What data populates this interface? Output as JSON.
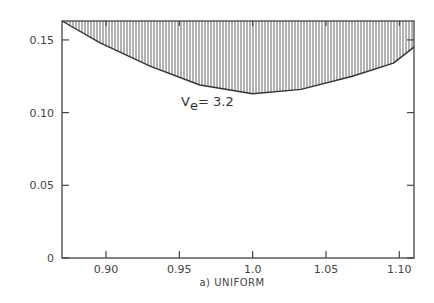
{
  "chart_data": {
    "type": "area",
    "title": "",
    "caption": "a) UNIFORM",
    "xlabel": "",
    "ylabel": "",
    "xlim": [
      0.87,
      1.11
    ],
    "ylim": [
      0,
      0.163
    ],
    "x_ticks": [
      "0.90",
      "0.95",
      "1.0",
      "1.05",
      "1.10"
    ],
    "y_ticks": [
      "0",
      "0.05",
      "0.10",
      "0.15"
    ],
    "grid": false,
    "annotation": {
      "text_main": "V",
      "text_sub": "e",
      "text_rest": "= 3.2"
    },
    "series": [
      {
        "name": "V_e = 3.2 boundary (hatched region above)",
        "x": [
          0.87,
          0.896,
          0.93,
          0.964,
          1.0,
          1.033,
          1.068,
          1.096,
          1.11
        ],
        "y": [
          0.163,
          0.148,
          0.132,
          0.119,
          0.113,
          0.116,
          0.125,
          0.134,
          0.145
        ]
      }
    ]
  }
}
